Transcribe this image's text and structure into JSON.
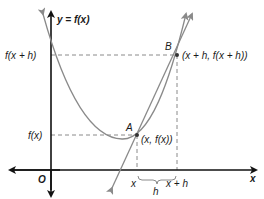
{
  "diagram": {
    "y_axis_label": "y = f(x)",
    "x_axis_label": "x",
    "origin_label": "O",
    "y_labels": {
      "upper": "f(x + h)",
      "lower": "f(x)"
    },
    "points": [
      {
        "name": "A",
        "coord_label": "(x, f(x))"
      },
      {
        "name": "B",
        "coord_label": "(x + h, f(x + h))"
      }
    ],
    "x_ticks": {
      "left": "x",
      "right": "x + h",
      "interval": "h"
    },
    "colors": {
      "axes": "#111111",
      "curve": "#8a8a8a",
      "dashed": "#8a8a8a",
      "text": "#1a1a1a"
    }
  }
}
